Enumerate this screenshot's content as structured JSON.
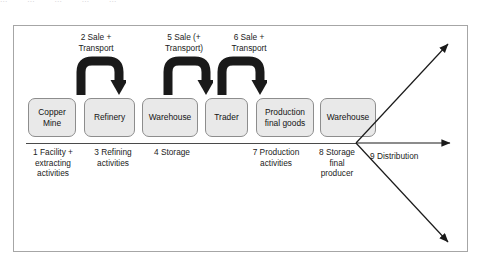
{
  "clipped_top_text": [
    "...",
    "...",
    "...",
    "...",
    "..."
  ],
  "diagram": {
    "colors": {
      "box_fill": "#e9e9e9",
      "box_border": "#8d8d8d",
      "frame_border": "#a6a6a6",
      "arrow": "#1a1a1a",
      "text": "#1b1b1b"
    },
    "sale_labels": [
      {
        "id": "sale-2",
        "text": "2 Sale +\nTransport"
      },
      {
        "id": "sale-5",
        "text": "5 Sale (+\nTransport)"
      },
      {
        "id": "sale-6",
        "text": "6 Sale +\nTransport"
      }
    ],
    "boxes": [
      {
        "id": "copper-mine",
        "text": "Copper\nMine"
      },
      {
        "id": "refinery",
        "text": "Refinery"
      },
      {
        "id": "warehouse-1",
        "text": "Warehouse"
      },
      {
        "id": "trader",
        "text": "Trader"
      },
      {
        "id": "production-final-goods",
        "text": "Production\nfinal goods"
      },
      {
        "id": "warehouse-2",
        "text": "Warehouse"
      }
    ],
    "captions": [
      {
        "id": "cap-1",
        "text": "1 Facility +\nextracting\nactivities"
      },
      {
        "id": "cap-3",
        "text": "3 Refining\nactivities"
      },
      {
        "id": "cap-4",
        "text": "4 Storage"
      },
      {
        "id": "cap-7",
        "text": "7 Production\nactivities"
      },
      {
        "id": "cap-8",
        "text": "8 Storage\nfinal\nproducer"
      }
    ],
    "distribution_label": "9 Distribution"
  }
}
